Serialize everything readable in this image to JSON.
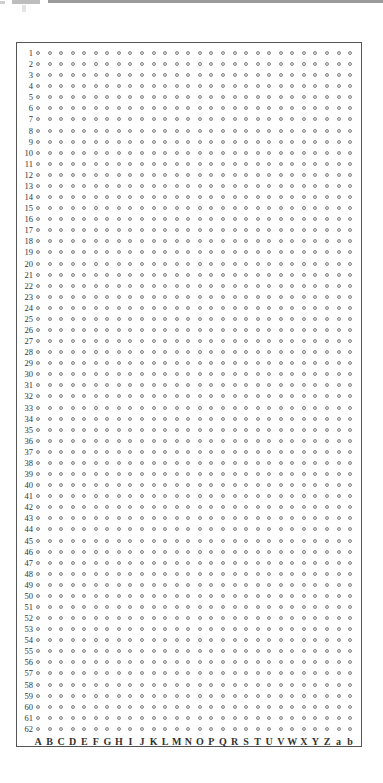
{
  "sheet": {
    "columns": [
      "A",
      "B",
      "C",
      "D",
      "E",
      "F",
      "G",
      "H",
      "I",
      "J",
      "K",
      "L",
      "M",
      "N",
      "O",
      "P",
      "Q",
      "R",
      "S",
      "T",
      "U",
      "V",
      "W",
      "X",
      "Y",
      "Z",
      "a",
      "b"
    ],
    "rows": [
      "1",
      "2",
      "3",
      "4",
      "5",
      "6",
      "7",
      "8",
      "9",
      "10",
      "11",
      "12",
      "13",
      "14",
      "15",
      "16",
      "17",
      "18",
      "19",
      "20",
      "21",
      "22",
      "23",
      "24",
      "25",
      "26",
      "27",
      "28",
      "29",
      "30",
      "31",
      "32",
      "33",
      "34",
      "35",
      "36",
      "37",
      "38",
      "39",
      "40",
      "41",
      "42",
      "43",
      "44",
      "45",
      "46",
      "47",
      "48",
      "49",
      "50",
      "51",
      "52",
      "53",
      "54",
      "55",
      "56",
      "57",
      "58",
      "59",
      "60",
      "61",
      "62"
    ],
    "dot_color": "#8a8a8a",
    "border_color": "#555555"
  }
}
